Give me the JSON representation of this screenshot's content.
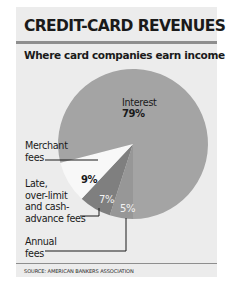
{
  "header": {
    "title": "CREDIT-CARD REVENUES",
    "subtitle": "Where card companies earn income"
  },
  "labels": {
    "interest_name": "Interest",
    "interest_pct": "79%",
    "merchant_name": "Merchant\nfees",
    "merchant_pct": "9%",
    "late_name": "Late,\nover-limit\nand cash-\nadvance fees",
    "late_pct": "7%",
    "annual_name": "Annual\nfees",
    "annual_pct": "5%"
  },
  "footer": {
    "source": "SOURCE: AMERICAN BANKERS ASSOCIATION"
  },
  "colors": {
    "panel_background": "#ececec",
    "rule": "#8e8e8e",
    "interest": "#a4a4a4",
    "merchant": "#f8f8f8",
    "late": "#7f7f7f",
    "annual": "#979797"
  },
  "chart_data": {
    "type": "pie",
    "title": "CREDIT-CARD REVENUES",
    "subtitle": "Where card companies earn income",
    "categories": [
      "Interest",
      "Merchant fees",
      "Late, over-limit and cash-advance fees",
      "Annual fees"
    ],
    "values": [
      79,
      9,
      7,
      5
    ],
    "unit": "%",
    "source": "SOURCE: AMERICAN BANKERS ASSOCIATION",
    "legend": "none (direct labels with leader lines)"
  }
}
